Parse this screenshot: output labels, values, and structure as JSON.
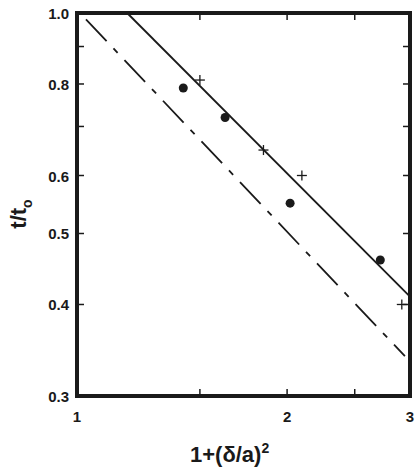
{
  "chart_data": {
    "type": "scatter",
    "title": "",
    "xlabel": "1+(δ/a)²",
    "ylabel": "t/t₀",
    "xscale": "log",
    "yscale": "log",
    "xlim": [
      1,
      3
    ],
    "ylim": [
      0.3,
      1.0
    ],
    "grid": false,
    "legend": null,
    "x_ticks": [
      {
        "value": 1,
        "label": "1"
      },
      {
        "value": 1.5,
        "label": ""
      },
      {
        "value": 2,
        "label": "2"
      },
      {
        "value": 2.5,
        "label": ""
      },
      {
        "value": 3,
        "label": "3"
      }
    ],
    "y_ticks": [
      {
        "value": 0.3,
        "label": "0.3"
      },
      {
        "value": 0.4,
        "label": "0.4"
      },
      {
        "value": 0.5,
        "label": "0.5"
      },
      {
        "value": 0.6,
        "label": "0.6"
      },
      {
        "value": 0.7,
        "label": ""
      },
      {
        "value": 0.8,
        "label": "0.8"
      },
      {
        "value": 0.9,
        "label": ""
      },
      {
        "value": 1.0,
        "label": "1.0"
      }
    ],
    "series": [
      {
        "name": "filled circles",
        "marker": "circle",
        "x": [
          1.42,
          1.63,
          2.02,
          2.72
        ],
        "y": [
          0.79,
          0.72,
          0.55,
          0.46
        ]
      },
      {
        "name": "crosses",
        "marker": "plus",
        "x": [
          1.5,
          1.85,
          2.1,
          2.92
        ],
        "y": [
          0.81,
          0.65,
          0.6,
          0.4
        ]
      },
      {
        "name": "solid line",
        "style": "solid",
        "x": [
          1.18,
          3.0
        ],
        "y": [
          1.0,
          0.41
        ]
      },
      {
        "name": "dashed line",
        "style": "dashed",
        "x": [
          1.03,
          2.95
        ],
        "y": [
          0.98,
          0.34
        ]
      }
    ]
  },
  "labels": {
    "x_axis_title_main": "1+(δ/a)",
    "x_axis_title_sup": "2",
    "y_axis_title_main": "t/t",
    "y_axis_title_sub": "o"
  }
}
